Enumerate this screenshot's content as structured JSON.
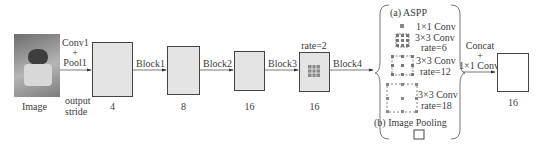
{
  "diagram": {
    "input": {
      "label": "Image",
      "icon": "cat-photo"
    },
    "stage_labels": {
      "conv1": "Conv1",
      "plus": "+",
      "pool1": "Pool1",
      "output": "output",
      "stride": "stride"
    },
    "blocks": [
      {
        "edge_label": "Block1",
        "stride": "4"
      },
      {
        "edge_label": "Block2",
        "stride": "8"
      },
      {
        "edge_label": "Block3",
        "stride": "16"
      },
      {
        "edge_label": "Block4",
        "stride": "16",
        "note": "rate=2"
      }
    ],
    "aspp": {
      "title": "(a) ASPP",
      "branches": [
        {
          "line1": "1×1 Conv",
          "line2": ""
        },
        {
          "line1": "3×3 Conv",
          "line2": "rate=6"
        },
        {
          "line1": "3×3 Conv",
          "line2": "rate=12"
        },
        {
          "line1": "3×3 Conv",
          "line2": "rate=18"
        }
      ],
      "pooling": "(b) Image Pooling"
    },
    "merge": {
      "line1": "Concat",
      "plus": "+",
      "line2": "1×1 Conv"
    },
    "output": {
      "stride": "16"
    }
  }
}
